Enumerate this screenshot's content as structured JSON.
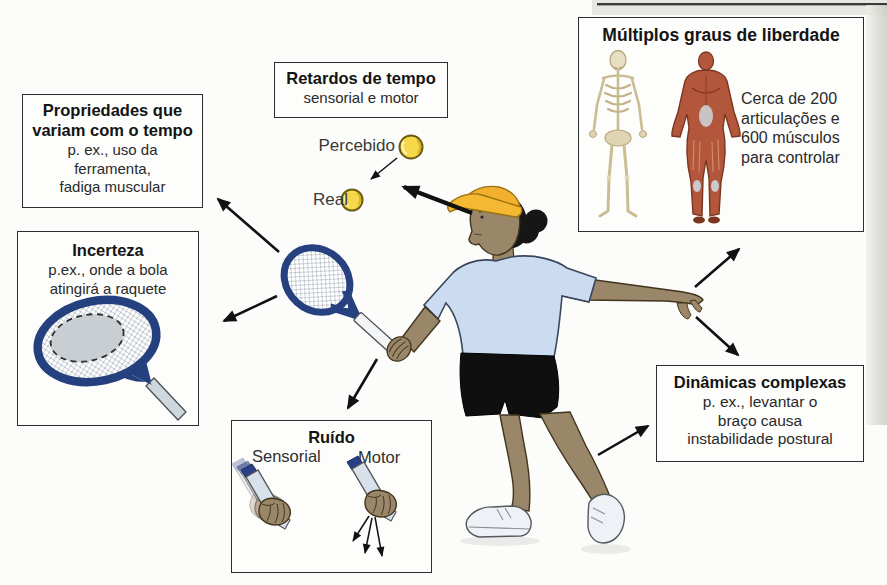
{
  "canvas": {
    "width": 887,
    "height": 585,
    "background": "#fcfcfa"
  },
  "palette": {
    "box_border": "#2d2d2d",
    "text": "#2a2a2a",
    "racket_frame_blue": "#27407f",
    "ball_yellow": "#f6d84a",
    "cap_yellow": "#f2b02e",
    "shirt_blue": "#ccdcf0",
    "skin_tan": "#9a8668",
    "shorts_black": "#0f0f0f",
    "shoe_white": "#eef1f5",
    "muscle_red": "#b2573b",
    "bone_beige": "#e8dfc2",
    "arrow_black": "#111111"
  },
  "boxes": {
    "propriedades": {
      "title": "Propriedades que\nvariam com o tempo",
      "body": "p. ex., uso da\nferramenta,\nfadiga muscular"
    },
    "retardos": {
      "title": "Retardos de tempo",
      "body": "sensorial e motor"
    },
    "multiplos": {
      "title": "Múltiplos graus de liberdade",
      "body": "Cerca de 200\narticulações e\n600 músculos\npara controlar"
    },
    "incerteza": {
      "title": "Incerteza",
      "body": "p.ex., onde a bola\natingirá a raquete"
    },
    "ruido": {
      "title": "Ruído",
      "left_label": "Sensorial",
      "right_label": "Motor"
    },
    "dinamicas": {
      "title": "Dinâmicas complexas",
      "body": "p. ex., levantar o\nbraço causa\ninstabilidade postural"
    }
  },
  "labels": {
    "perceived": "Percebido",
    "real": "Real"
  }
}
